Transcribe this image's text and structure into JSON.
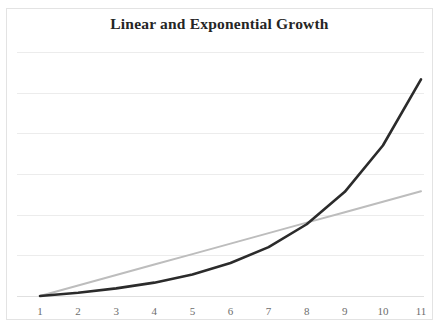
{
  "chart_data": {
    "type": "line",
    "title": "Linear and Exponential Growth",
    "xlabel": "",
    "ylabel": "",
    "grid": true,
    "grid_axis": "y",
    "legend": false,
    "x": [
      1,
      2,
      3,
      4,
      5,
      6,
      7,
      8,
      9,
      10,
      11
    ],
    "xtick_labels": [
      "1",
      "2",
      "3",
      "4",
      "5",
      "6",
      "7",
      "8",
      "9",
      "10",
      "11"
    ],
    "xlim": [
      1,
      11
    ],
    "ylim": [
      0,
      8
    ],
    "ytick_labels": [],
    "y_gridline_count": 7,
    "series": [
      {
        "name": "Linear",
        "color": "#bdbdbd",
        "width": 2,
        "values": [
          0,
          0.33,
          0.66,
          0.99,
          1.32,
          1.65,
          1.98,
          2.31,
          2.64,
          2.97,
          3.3
        ]
      },
      {
        "name": "Exponential",
        "color": "#2b2b2b",
        "width": 2.6,
        "values": [
          0,
          0.1,
          0.24,
          0.42,
          0.68,
          1.04,
          1.54,
          2.26,
          3.28,
          4.74,
          6.82
        ]
      }
    ],
    "colors": {
      "linear": "#bdbdbd",
      "exponential": "#2b2b2b",
      "gridline": "#ececec",
      "border": "#e3e3e3",
      "tick_label": "#6d6d6d",
      "title": "#252525",
      "background": "#ffffff"
    }
  }
}
